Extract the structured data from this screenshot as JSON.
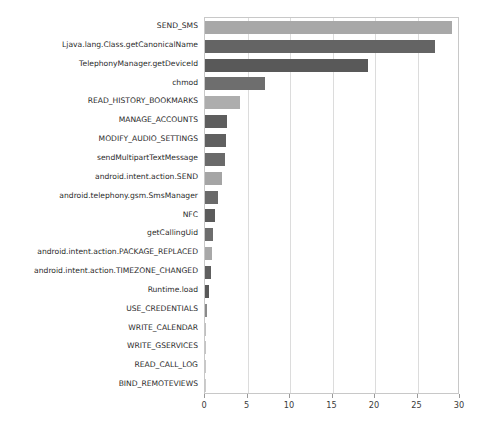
{
  "chart_data": {
    "type": "bar",
    "orientation": "horizontal",
    "title": "",
    "xlabel": "",
    "ylabel": "",
    "xlim": [
      0,
      30
    ],
    "xticks": [
      0,
      5,
      10,
      15,
      20,
      25,
      30
    ],
    "xtick_labels": [
      "0",
      "5",
      "10",
      "15",
      "20",
      "25",
      "30"
    ],
    "grid": "vertical",
    "legend": "none",
    "categories": [
      "SEND_SMS",
      "Ljava.lang.Class.getCanonicalName",
      "TelephonyManager.getDeviceId",
      "chmod",
      "READ_HISTORY_BOOKMARKS",
      "MANAGE_ACCOUNTS",
      "MODIFY_AUDIO_SETTINGS",
      "sendMultipartTextMessage",
      "android.intent.action.SEND",
      "android.telephony.gsm.SmsManager",
      "NFC",
      "getCallingUid",
      "android.intent.action.PACKAGE_REPLACED",
      "android.intent.action.TIMEZONE_CHANGED",
      "Runtime.load",
      "USE_CREDENTIALS",
      "WRITE_CALENDAR",
      "WRITE_GSERVICES",
      "READ_CALL_LOG",
      "BIND_REMOTEVIEWS"
    ],
    "values": [
      29.0,
      27.0,
      19.2,
      7.0,
      4.1,
      2.6,
      2.5,
      2.3,
      2.0,
      1.5,
      1.2,
      0.9,
      0.8,
      0.7,
      0.45,
      0.25,
      0.12,
      0.1,
      0.08,
      0.06
    ],
    "bar_colors": [
      "#a8a8a8",
      "#646464",
      "#595959",
      "#6e6e6e",
      "#adadad",
      "#5e5e5e",
      "#606060",
      "#6a6a6a",
      "#a5a5a5",
      "#6a6a6a",
      "#5b5b5b",
      "#6d6d6d",
      "#a8a8a8",
      "#5f5f5f",
      "#585858",
      "#8a8a8a",
      "#c0c0c0",
      "#c4c4c4",
      "#c8c8c8",
      "#cccccc"
    ]
  },
  "style": {
    "plot_border_color": "#c8c8c8",
    "gridline_color": "#dcdcdc",
    "tick_color": "#9a9a9a",
    "label_color": "#2b2b2b",
    "background": "#ffffff"
  }
}
